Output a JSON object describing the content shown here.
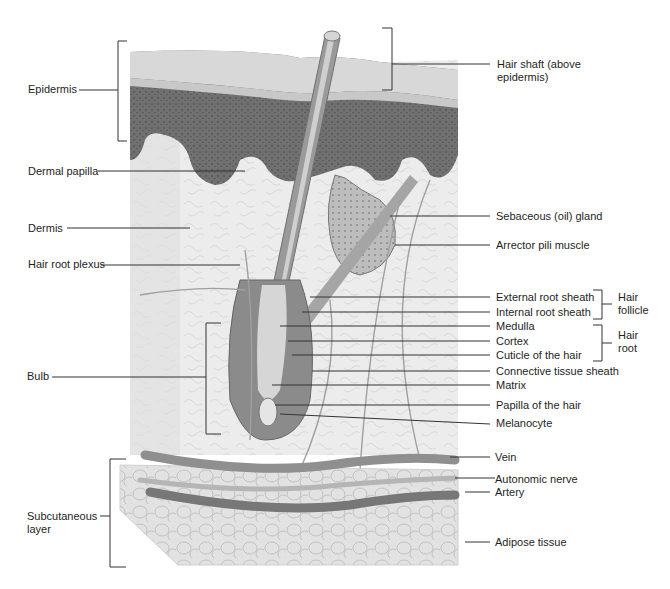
{
  "figure": {
    "colors": {
      "background": "#ffffff",
      "stratum_corneum": "#d9d9d9",
      "epidermis_dark": "#6f6f6f",
      "dermis": "#ececec",
      "hair_shaft": "#9a9a9a",
      "vessel": "#8c8c8c",
      "leader_line": "#333333",
      "label_text": "#1e1e1e"
    }
  },
  "labels_left": {
    "epidermis": "Epidermis",
    "dermal_papilla": "Dermal papilla",
    "dermis": "Dermis",
    "hair_root_plexus": "Hair root plexus",
    "bulb": "Bulb",
    "subcutaneous_layer": "Subcutaneous layer"
  },
  "labels_right": {
    "hair_shaft": "Hair shaft (above epidermis)",
    "sebaceous_gland": "Sebaceous (oil) gland",
    "arrector_pili": "Arrector pili muscle",
    "external_root_sheath": "External root sheath",
    "internal_root_sheath": "Internal root sheath",
    "medulla": "Medulla",
    "cortex": "Cortex",
    "cuticle": "Cuticle of the hair",
    "connective_tissue_sheath": "Connective tissue sheath",
    "matrix": "Matrix",
    "papilla_of_hair": "Papilla of the hair",
    "melanocyte": "Melanocyte",
    "vein": "Vein",
    "autonomic_nerve": "Autonomic nerve",
    "artery": "Artery",
    "adipose_tissue": "Adipose tissue"
  },
  "group_labels": {
    "hair_follicle": "Hair follicle",
    "hair_root": "Hair root"
  }
}
